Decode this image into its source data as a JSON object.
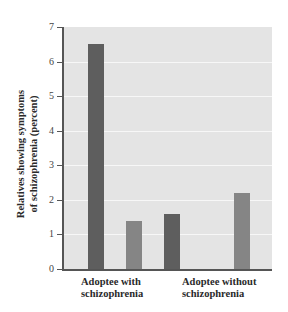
{
  "chart_data": {
    "type": "bar",
    "title": "",
    "xlabel": "",
    "ylabel": "Relatives showing symptoms of schizophrenia (percent)",
    "ylabel_lines": [
      "Relatives showing symptoms",
      "of schizophrenia (percent)"
    ],
    "categories": [
      "Adoptee with schizophrenia",
      "Adoptee without schizophrenia"
    ],
    "category_lines": [
      [
        "Adoptee with",
        "schizophrenia"
      ],
      [
        "Adoptee without",
        "schizophrenia"
      ]
    ],
    "series": [
      {
        "name": "Series 1 (dark bar)",
        "color": "#5e5e5e",
        "values": [
          6.5,
          1.6
        ]
      },
      {
        "name": "Series 2 (light bar)",
        "color": "#858585",
        "values": [
          1.4,
          2.2
        ]
      }
    ],
    "ylim": [
      0,
      7
    ],
    "yticks": [
      "0",
      "1",
      "2",
      "3",
      "4",
      "5",
      "6",
      "7"
    ],
    "grid": true,
    "legend": null,
    "background_color": "#e4e4e4"
  }
}
